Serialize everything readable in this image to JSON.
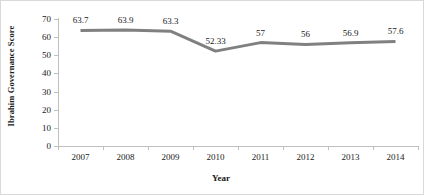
{
  "chart_data": {
    "type": "line",
    "title": "",
    "xlabel": "Year",
    "ylabel": "Ibrahim Governance Score",
    "categories": [
      "2007",
      "2008",
      "2009",
      "2010",
      "2011",
      "2012",
      "2013",
      "2014"
    ],
    "values": [
      63.7,
      63.9,
      63.3,
      52.33,
      57,
      56,
      56.9,
      57.6
    ],
    "labels": [
      "63.7",
      "63.9",
      "63.3",
      "52.33",
      "57",
      "56",
      "56.9",
      "57.6"
    ],
    "ylim": [
      0,
      70
    ],
    "yticks": [
      0,
      10,
      20,
      30,
      40,
      50,
      60,
      70
    ],
    "ytick_labels": [
      "0",
      "10",
      "20",
      "30",
      "40",
      "50",
      "60",
      "70"
    ],
    "grid": false,
    "legend": "none",
    "series_color": "#808080",
    "axis_color": "#bfbfbf",
    "text_color": "#1a1a1a"
  }
}
